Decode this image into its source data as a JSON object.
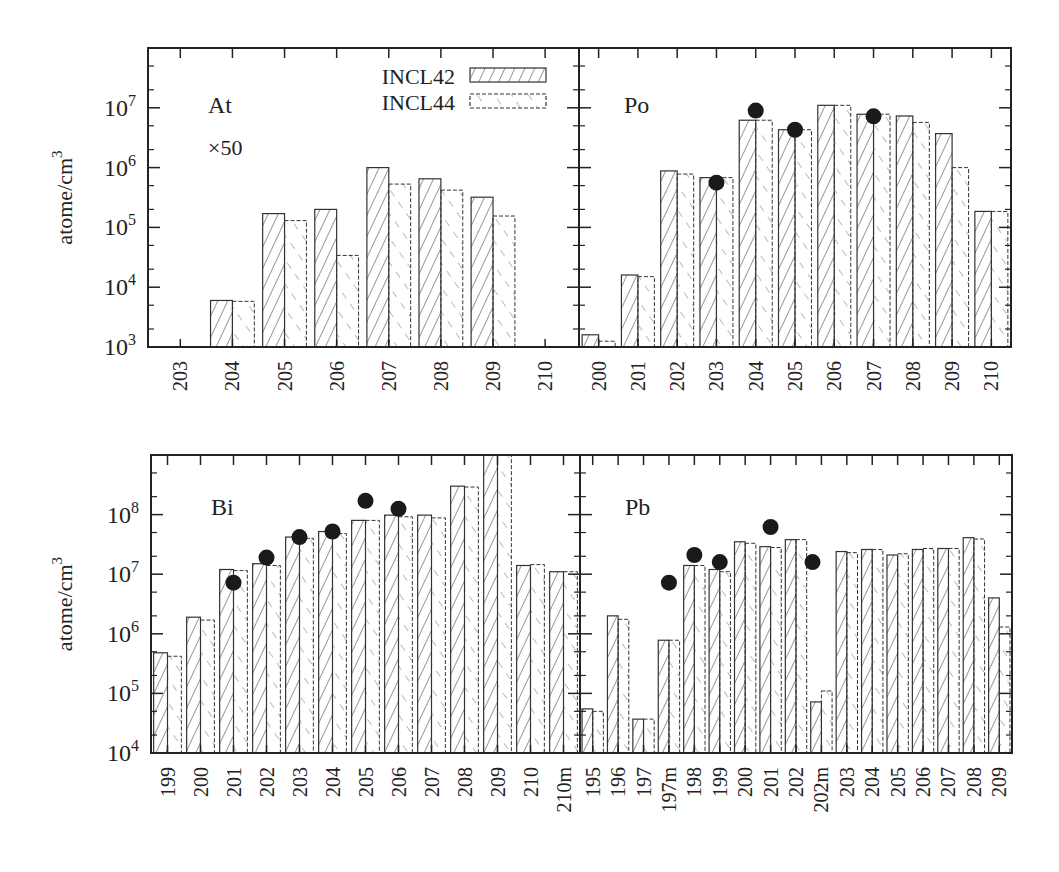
{
  "figure": {
    "ylabel": "atome/cm",
    "ylabel_sup": "3",
    "legend": [
      {
        "label": "INCL42",
        "pattern": "hatch-forward-solid"
      },
      {
        "label": "INCL44",
        "pattern": "hatch-back-dashed"
      }
    ],
    "colors": {
      "axis": "#222222",
      "bar_stroke": "#333333",
      "marker": "#1a1a1a",
      "background": "#ffffff"
    }
  },
  "chart_data": [
    {
      "type": "bar",
      "panel": "top-left",
      "title": "At",
      "annotation": "×50",
      "ylabel": "atome/cm^3",
      "yscale": "log",
      "ylim": [
        1000,
        100000000
      ],
      "yticks": [
        "10^3",
        "10^4",
        "10^5",
        "10^6",
        "10^7"
      ],
      "categories": [
        "203",
        "204",
        "205",
        "206",
        "207",
        "208",
        "209",
        "210"
      ],
      "series": [
        {
          "name": "INCL42",
          "values": [
            null,
            6000,
            170000,
            200000,
            1000000,
            650000,
            320000,
            null
          ]
        },
        {
          "name": "INCL44",
          "values": [
            null,
            5800,
            130000,
            34000,
            530000,
            420000,
            155000,
            null
          ]
        },
        {
          "name": "Experiment",
          "type": "scatter",
          "values": [
            null,
            null,
            null,
            null,
            null,
            null,
            null,
            null
          ]
        }
      ],
      "legend_position": "top-right"
    },
    {
      "type": "bar",
      "panel": "top-right",
      "title": "Po",
      "ylabel": "atome/cm^3",
      "yscale": "log",
      "ylim": [
        1000,
        100000000
      ],
      "categories": [
        "200",
        "201",
        "202",
        "203",
        "204",
        "205",
        "206",
        "207",
        "208",
        "209",
        "210"
      ],
      "series": [
        {
          "name": "INCL42",
          "values": [
            1600,
            16000,
            880000,
            680000,
            6200000,
            4300000,
            11000000,
            7800000,
            7300000,
            3700000,
            185000
          ]
        },
        {
          "name": "INCL44",
          "values": [
            1250,
            15000,
            780000,
            680000,
            6200000,
            4300000,
            11000000,
            7800000,
            5700000,
            1000000,
            185000
          ]
        },
        {
          "name": "Experiment",
          "type": "scatter",
          "values": [
            null,
            null,
            null,
            560000,
            9000000,
            null,
            null,
            7200000,
            null,
            null,
            null
          ],
          "extra_points": [
            {
              "x": "205",
              "y": 4300000
            }
          ]
        }
      ]
    },
    {
      "type": "bar",
      "panel": "bottom-left",
      "title": "Bi",
      "ylabel": "atome/cm^3",
      "yscale": "log",
      "ylim": [
        10000,
        1000000000
      ],
      "yticks": [
        "10^4",
        "10^5",
        "10^6",
        "10^7",
        "10^8"
      ],
      "categories": [
        "199",
        "200",
        "201",
        "202",
        "203",
        "204",
        "205",
        "206",
        "207",
        "208",
        "209",
        "210",
        "210m"
      ],
      "series": [
        {
          "name": "INCL42",
          "values": [
            480000,
            1900000,
            12000000,
            15000000,
            42000000,
            52000000,
            80000000,
            98000000,
            98000000,
            300000000,
            1000000000,
            14000000,
            11000000
          ]
        },
        {
          "name": "INCL44",
          "values": [
            420000,
            1700000,
            11500000,
            14000000,
            40000000,
            48000000,
            80000000,
            92000000,
            88000000,
            290000000,
            1000000000,
            14500000,
            11000000
          ]
        },
        {
          "name": "Experiment",
          "type": "scatter",
          "values": [
            null,
            null,
            7200000,
            19000000,
            42000000,
            52000000,
            170000000,
            125000000,
            null,
            null,
            null,
            null,
            null
          ]
        }
      ]
    },
    {
      "type": "bar",
      "panel": "bottom-right",
      "title": "Pb",
      "ylabel": "atome/cm^3",
      "yscale": "log",
      "ylim": [
        10000,
        1000000000
      ],
      "categories": [
        "195",
        "196",
        "197",
        "197m",
        "198",
        "199",
        "200",
        "201",
        "202",
        "202m",
        "203",
        "204",
        "205",
        "206",
        "207",
        "208",
        "209"
      ],
      "series": [
        {
          "name": "INCL42",
          "values": [
            55000,
            2000000,
            37000,
            780000,
            14000000,
            12000000,
            35000000,
            29000000,
            38000000,
            72000,
            24000000,
            26000000,
            21000000,
            26000000,
            27000000,
            41000000,
            4000000
          ]
        },
        {
          "name": "INCL44",
          "values": [
            50000,
            1750000,
            37000,
            780000,
            14000000,
            11000000,
            33000000,
            28000000,
            38000000,
            110000,
            23000000,
            26000000,
            22000000,
            27000000,
            27000000,
            39000000,
            1300000
          ]
        },
        {
          "name": "Experiment",
          "type": "scatter",
          "values": [
            null,
            null,
            null,
            7200000,
            21000000,
            16000000,
            null,
            62000000,
            null,
            16000000,
            null,
            null,
            null,
            null,
            null,
            null,
            null
          ]
        }
      ]
    }
  ]
}
